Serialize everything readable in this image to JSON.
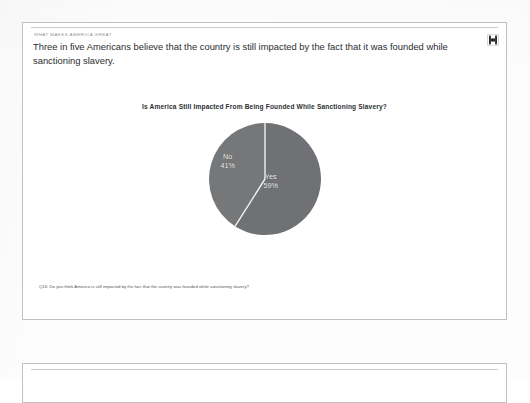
{
  "page": {
    "eyebrow": "WHAT MAKES AMERICA GREAT",
    "headline": "Three in five Americans believe that the country is still impacted by the fact that it was founded while sanctioning slavery.",
    "logo_name": "brand-logo"
  },
  "footnote": {
    "text": "Q16: Do you think America is still impacted by the fact that the country was founded while sanctioning slavery?"
  },
  "chart_data": {
    "type": "pie",
    "title": "Is America Still Impacted From Being Founded While Sanctioning Slavery?",
    "categories": [
      "Yes",
      "No"
    ],
    "values": [
      59,
      41
    ],
    "labels": [
      "Yes 59%",
      "No 41%"
    ],
    "slices": [
      {
        "name": "Yes",
        "label": "Yes",
        "value": 59,
        "percent": "59%",
        "color": "#6f7174"
      },
      {
        "name": "No",
        "label": "No",
        "value": 41,
        "percent": "41%",
        "color": "#757779"
      }
    ],
    "legend": "none",
    "start_angle_deg": 0,
    "direction": "clockwise",
    "units": "percent",
    "xlabel": "",
    "ylabel": ""
  },
  "colors": {
    "slice_yes": "#6f7174",
    "slice_no": "#757779",
    "divider": "#f0f0ee",
    "page_border": "#bfc1c3",
    "text_primary": "#2b2d2f",
    "text_muted": "#8e9194"
  }
}
